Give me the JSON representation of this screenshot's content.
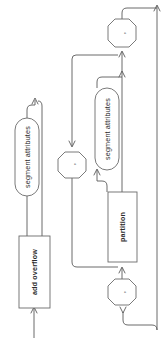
{
  "diagram": {
    "type": "railroad-diagram",
    "orientation": "rotated-90-ccw",
    "background_color": "#ffffff",
    "line_color": "#5a5a5a",
    "text_color": "#2b2b2b",
    "nodes": [
      {
        "id": "add-overflow",
        "label": "add overflow",
        "shape": "rectangle",
        "emphasis": "bold"
      },
      {
        "id": "segment-attributes-1",
        "label": "segment attributes",
        "shape": "stadium",
        "emphasis": "normal"
      },
      {
        "id": "comma-1",
        "label": ",",
        "shape": "octagon",
        "emphasis": "normal"
      },
      {
        "id": "segment-attributes-2",
        "label": "segment attributes",
        "shape": "stadium",
        "emphasis": "normal"
      },
      {
        "id": "partition",
        "label": "partition",
        "shape": "rectangle",
        "emphasis": "bold"
      },
      {
        "id": "comma-2",
        "label": ",",
        "shape": "octagon",
        "emphasis": "normal"
      },
      {
        "id": "comma-3",
        "label": ",",
        "shape": "octagon",
        "emphasis": "normal"
      }
    ]
  }
}
